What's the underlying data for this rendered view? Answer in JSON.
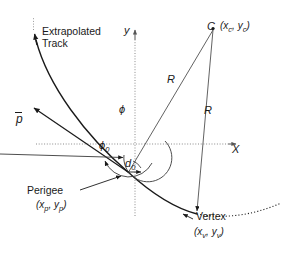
{
  "figure": {
    "type": "diagram",
    "background_color": "#ffffff",
    "stroke_color": "#1a1a1a",
    "axis_color": "#808080"
  },
  "axes": {
    "x_label": "X",
    "y_label": "y",
    "origin_px": [
      135,
      144
    ],
    "x_axis_style": "dotted",
    "y_axis_style": "dotted",
    "x_axis_arrow": true,
    "y_axis_arrow": true
  },
  "labels": {
    "extrapolated_track_line1": "Extrapolated",
    "extrapolated_track_line2": "Track",
    "momentum": "p",
    "center_point": "C",
    "center_coord_open": "(",
    "center_coord_x": "x",
    "center_coord_x_sub": "c",
    "center_coord_sep": ", ",
    "center_coord_y": "y",
    "center_coord_y_sub": "c",
    "center_coord_close": ")",
    "radius_1": "R",
    "radius_2": "R",
    "phi": "ϕ",
    "phi0": "ϕ",
    "phi0_sub": "0",
    "d0": "d",
    "d0_sub": "0",
    "perigee": "Perigee",
    "perigee_coord_x": "x",
    "perigee_coord_x_sub": "p",
    "perigee_coord_y": "y",
    "perigee_coord_y_sub": "p",
    "vertex": "Vertex",
    "vertex_coord_x": "x",
    "vertex_coord_x_sub": "v",
    "vertex_coord_y": "y",
    "vertex_coord_y_sub": "v",
    "paren_open": "(",
    "paren_close": ")",
    "comma": ", "
  },
  "geometry": {
    "center_C_px": [
      213,
      28
    ],
    "perigee_px": [
      128,
      172
    ],
    "vertex_px": [
      197,
      214
    ],
    "track_arrow_tip_px": [
      33,
      32
    ],
    "momentum_arrow_tip_px": [
      33,
      107
    ],
    "radius_label_1_px": [
      172,
      80
    ],
    "radius_label_2_px": [
      209,
      111
    ]
  }
}
